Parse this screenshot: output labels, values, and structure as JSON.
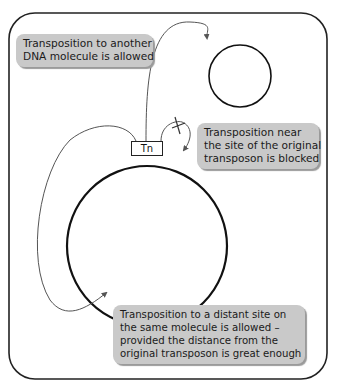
{
  "callouts": {
    "another_molecule": {
      "lines": [
        "Transposition to another",
        "DNA molecule is allowed"
      ]
    },
    "near_site": {
      "lines": [
        "Transposition near",
        "the site of the original",
        "transposon is blocked"
      ]
    },
    "distant_site": {
      "lines": [
        "Transposition to a distant site on",
        "the same molecule is allowed –",
        "provided the distance from the",
        "original transposon is great enough"
      ]
    }
  },
  "transposon": {
    "label": "Tn"
  },
  "colors": {
    "frame": "#222222",
    "callout_bg": "#c9c9c9",
    "arrow": "#555555",
    "circle": "#111111"
  }
}
